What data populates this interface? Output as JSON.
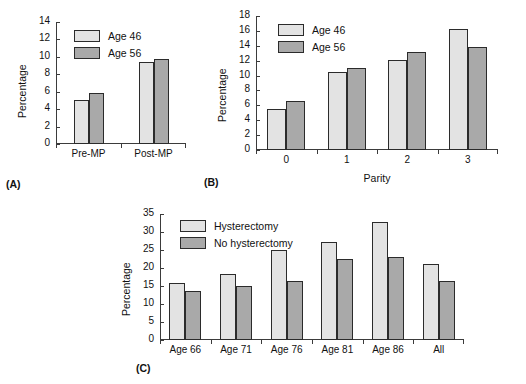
{
  "figure": {
    "panel_tags": {
      "a": "(A)",
      "b": "(B)",
      "c": "(C)"
    },
    "colors": {
      "series_light": "#e3e3e3",
      "series_dark": "#a9a9a9",
      "axis": "#3b3b3b",
      "bar_border": "#2b2b2b",
      "background": "#ffffff"
    }
  },
  "chart_data": [
    {
      "id": "A",
      "type": "bar",
      "title": "",
      "xlabel": "",
      "ylabel": "Percentage",
      "ylim": [
        0,
        14
      ],
      "yticks": [
        0,
        2,
        4,
        6,
        8,
        10,
        12,
        14
      ],
      "grid": false,
      "legend_position": "top-left",
      "categories": [
        "Pre-MP",
        "Post-MP"
      ],
      "series": [
        {
          "name": "Age 46",
          "values": [
            5.0,
            9.4
          ]
        },
        {
          "name": "Age 56",
          "values": [
            5.9,
            9.7
          ]
        }
      ]
    },
    {
      "id": "B",
      "type": "bar",
      "title": "",
      "xlabel": "Parity",
      "ylabel": "Percentage",
      "ylim": [
        0,
        18
      ],
      "yticks": [
        0,
        2,
        4,
        6,
        8,
        10,
        12,
        14,
        16,
        18
      ],
      "grid": false,
      "legend_position": "top-left",
      "categories": [
        "0",
        "1",
        "2",
        "3"
      ],
      "series": [
        {
          "name": "Age 46",
          "values": [
            5.5,
            10.5,
            12.1,
            16.3
          ]
        },
        {
          "name": "Age 56",
          "values": [
            6.6,
            11.0,
            13.1,
            13.9
          ]
        }
      ]
    },
    {
      "id": "C",
      "type": "bar",
      "title": "",
      "xlabel": "",
      "ylabel": "Percentage",
      "ylim": [
        0,
        35
      ],
      "yticks": [
        0,
        5,
        10,
        15,
        20,
        25,
        30,
        35
      ],
      "grid": false,
      "legend_position": "top-left",
      "categories": [
        "Age 66",
        "Age 71",
        "Age 76",
        "Age 81",
        "Age 86",
        "All"
      ],
      "series": [
        {
          "name": "Hysterectomy",
          "values": [
            15.8,
            18.3,
            24.9,
            27.3,
            32.8,
            21.0
          ]
        },
        {
          "name": "No hysterectomy",
          "values": [
            13.6,
            15.1,
            16.5,
            22.4,
            23.1,
            16.3
          ]
        }
      ]
    }
  ]
}
